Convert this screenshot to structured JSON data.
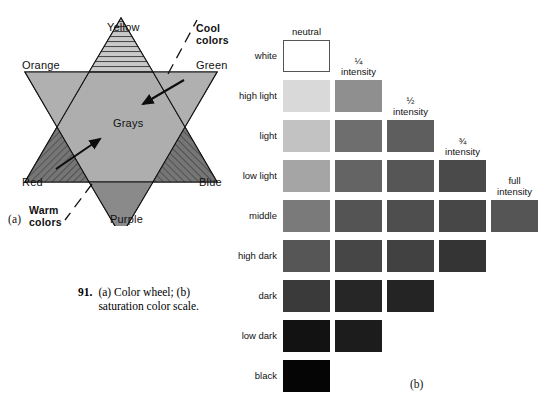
{
  "figure_a": {
    "panel_label": "(a)",
    "center_label": "Grays",
    "vertices": [
      {
        "name": "yellow",
        "label": "Yellow"
      },
      {
        "name": "orange",
        "label": "Orange"
      },
      {
        "name": "green",
        "label": "Green"
      },
      {
        "name": "red",
        "label": "Red"
      },
      {
        "name": "blue",
        "label": "Blue"
      },
      {
        "name": "purple",
        "label": "Purple"
      }
    ],
    "annotations": [
      {
        "name": "cool",
        "line1": "Cool",
        "line2": "colors"
      },
      {
        "name": "warm",
        "line1": "Warm",
        "line2": "colors"
      }
    ],
    "colors": {
      "upward_triangle": "#b9b9b9",
      "downward_triangle": "#9a9a9a",
      "overlap": "#a8a8a8",
      "dark_tip": "#707070",
      "outline": "#1a1a1a"
    }
  },
  "caption": {
    "number": "91.",
    "text": "(a) Color wheel; (b) saturation color scale."
  },
  "figure_b": {
    "panel_label": "(b)",
    "column_headers": [
      {
        "name": "neutral",
        "line1": "neutral",
        "line2": ""
      },
      {
        "name": "quarter-intensity",
        "line1": "¼",
        "line2": "intensity"
      },
      {
        "name": "half-intensity",
        "line1": "½",
        "line2": "intensity"
      },
      {
        "name": "three-quarter-intensity",
        "line1": "¾",
        "line2": "intensity"
      },
      {
        "name": "full-intensity",
        "line1": "full",
        "line2": "intensity"
      }
    ],
    "row_labels": [
      "white",
      "high light",
      "light",
      "low light",
      "middle",
      "high dark",
      "dark",
      "low dark",
      "black"
    ],
    "swatches": [
      {
        "row": "white",
        "col": "neutral",
        "color": "#ffffff"
      },
      {
        "row": "high light",
        "col": "neutral",
        "color": "#d9d9d9"
      },
      {
        "row": "high light",
        "col": "quarter-intensity",
        "color": "#8f8f8f"
      },
      {
        "row": "light",
        "col": "neutral",
        "color": "#c2c2c2"
      },
      {
        "row": "light",
        "col": "quarter-intensity",
        "color": "#6e6e6e"
      },
      {
        "row": "light",
        "col": "half-intensity",
        "color": "#5e5e5e"
      },
      {
        "row": "low light",
        "col": "neutral",
        "color": "#a5a5a5"
      },
      {
        "row": "low light",
        "col": "quarter-intensity",
        "color": "#646464"
      },
      {
        "row": "low light",
        "col": "half-intensity",
        "color": "#565656"
      },
      {
        "row": "low light",
        "col": "three-quarter-intensity",
        "color": "#4a4a4a"
      },
      {
        "row": "middle",
        "col": "neutral",
        "color": "#7a7a7a"
      },
      {
        "row": "middle",
        "col": "quarter-intensity",
        "color": "#545454"
      },
      {
        "row": "middle",
        "col": "half-intensity",
        "color": "#4e4e4e"
      },
      {
        "row": "middle",
        "col": "three-quarter-intensity",
        "color": "#474747"
      },
      {
        "row": "middle",
        "col": "full-intensity",
        "color": "#555555"
      },
      {
        "row": "high dark",
        "col": "neutral",
        "color": "#565656"
      },
      {
        "row": "high dark",
        "col": "quarter-intensity",
        "color": "#464646"
      },
      {
        "row": "high dark",
        "col": "half-intensity",
        "color": "#414141"
      },
      {
        "row": "high dark",
        "col": "three-quarter-intensity",
        "color": "#343434"
      },
      {
        "row": "dark",
        "col": "neutral",
        "color": "#3a3a3a"
      },
      {
        "row": "dark",
        "col": "quarter-intensity",
        "color": "#262626"
      },
      {
        "row": "dark",
        "col": "half-intensity",
        "color": "#242424"
      },
      {
        "row": "low dark",
        "col": "neutral",
        "color": "#121212"
      },
      {
        "row": "low dark",
        "col": "quarter-intensity",
        "color": "#1c1c1c"
      },
      {
        "row": "black",
        "col": "neutral",
        "color": "#050505"
      }
    ]
  }
}
